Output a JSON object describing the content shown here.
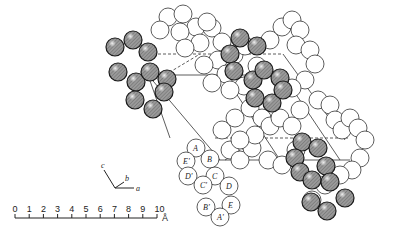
{
  "diagram": {
    "type": "crystal-structure-packing",
    "sphere_types": [
      "shaded",
      "open"
    ],
    "colors": {
      "shaded_fill": "#8a8a8a",
      "open_fill": "#ffffff",
      "outline": "#222222",
      "cell_line": "#333333"
    },
    "labeled_molecule": {
      "labels": [
        "A",
        "B",
        "C",
        "D",
        "E",
        "E'",
        "D'",
        "C'",
        "B'",
        "A'"
      ]
    },
    "axes": {
      "labels": [
        "c",
        "b",
        "a"
      ]
    },
    "scale_bar": {
      "ticks": [
        "0",
        "1",
        "2",
        "3",
        "4",
        "5",
        "6",
        "7",
        "8",
        "9",
        "10"
      ],
      "unit": "Å"
    }
  }
}
